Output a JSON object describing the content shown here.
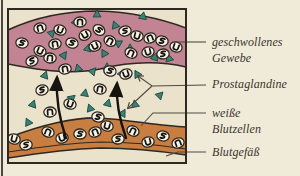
{
  "figure": {
    "labels": {
      "swollen_tissue": "geschwollenes\nGewebe",
      "prostaglandins": "Prostaglandine",
      "white_blood_cells": "weiße\nBlutzellen",
      "blood_vessel": "Blutgefäß"
    }
  },
  "colors": {
    "page_background": "#f0ead9",
    "box_background": "#ebe2cc",
    "tissue_pink": "#c28492",
    "vessel_orange": "#c97e41",
    "prostaglandin_teal": "#3c8173",
    "cell_fill": "#f7f2e4",
    "outline": "#2d2822",
    "callout_line": "#4f4a42",
    "text": "#3a342c"
  },
  "diagram": {
    "box": [
      8,
      9,
      178,
      154
    ],
    "tissue_band": {
      "path": "M8,30 C40,15 70,11 98,11 C130,12 162,19 186,28 L186,67 C160,61 132,61 100,69 C70,75 38,70 8,64 Z"
    },
    "vessel": {
      "path": "M8,138 C40,125 75,117 100,118 C130,120 160,126 186,127 L186,155 C160,151 135,148 100,148 C70,149 40,153 8,158 Z",
      "inner_wall": "M8,152 C40,147 70,143 100,142 C135,142 160,145 186,149"
    },
    "cells": {
      "tissue": [
        [
          22,
          43,
          10,
          0
        ],
        [
          40,
          28,
          -15,
          1
        ],
        [
          60,
          30,
          20,
          2
        ],
        [
          80,
          22,
          0,
          1
        ],
        [
          99,
          30,
          35,
          0
        ],
        [
          85,
          35,
          -30,
          2
        ],
        [
          72,
          43,
          15,
          0
        ],
        [
          55,
          44,
          -10,
          1
        ],
        [
          40,
          51,
          25,
          2
        ],
        [
          32,
          61,
          -20,
          0
        ],
        [
          50,
          58,
          5,
          1
        ],
        [
          95,
          46,
          -25,
          2
        ],
        [
          110,
          41,
          30,
          1
        ],
        [
          125,
          31,
          -10,
          0
        ],
        [
          137,
          36,
          15,
          2
        ],
        [
          150,
          38,
          -20,
          1
        ],
        [
          162,
          41,
          10,
          0
        ],
        [
          148,
          52,
          -15,
          2
        ],
        [
          131,
          53,
          25,
          1
        ],
        [
          163,
          54,
          -5,
          0
        ],
        [
          176,
          47,
          20,
          2
        ]
      ],
      "interstitium": [
        [
          65,
          69,
          -10,
          1
        ],
        [
          110,
          71,
          15,
          0
        ],
        [
          126,
          74,
          -20,
          2
        ],
        [
          100,
          89,
          10,
          1
        ],
        [
          42,
          90,
          -15,
          0
        ],
        [
          70,
          104,
          20,
          2
        ],
        [
          50,
          112,
          -5,
          1
        ],
        [
          98,
          117,
          10,
          0
        ]
      ],
      "vessel": [
        [
          14,
          139,
          15,
          2
        ],
        [
          26,
          145,
          -10,
          0
        ],
        [
          48,
          132,
          20,
          1
        ],
        [
          62,
          138,
          -15,
          2
        ],
        [
          80,
          134,
          5,
          0
        ],
        [
          95,
          132,
          -20,
          1
        ],
        [
          107,
          126,
          15,
          2
        ],
        [
          118,
          139,
          -5,
          0
        ],
        [
          133,
          131,
          25,
          1
        ],
        [
          148,
          142,
          -15,
          2
        ],
        [
          163,
          136,
          10,
          0
        ],
        [
          178,
          143,
          -20,
          1
        ]
      ]
    },
    "triangles": {
      "tissue": [
        [
          97,
          14,
          0
        ],
        [
          76,
          22,
          30
        ],
        [
          115,
          25,
          -20
        ],
        [
          143,
          16,
          10
        ],
        [
          52,
          33,
          45
        ],
        [
          88,
          48,
          15
        ],
        [
          104,
          53,
          -30
        ],
        [
          119,
          43,
          60
        ],
        [
          130,
          48,
          0
        ],
        [
          155,
          57,
          20
        ],
        [
          169,
          58,
          -15
        ],
        [
          64,
          55,
          35
        ]
      ],
      "interstitium": [
        [
          45,
          75,
          20
        ],
        [
          78,
          68,
          -15
        ],
        [
          93,
          71,
          40
        ],
        [
          107,
          67,
          0
        ],
        [
          122,
          73,
          25
        ],
        [
          137,
          74,
          -30
        ],
        [
          85,
          93,
          10
        ],
        [
          72,
          98,
          50
        ],
        [
          90,
          108,
          -20
        ],
        [
          108,
          103,
          15
        ],
        [
          123,
          113,
          30
        ],
        [
          135,
          104,
          -10
        ],
        [
          160,
          95,
          45
        ],
        [
          33,
          104,
          20
        ],
        [
          28,
          122,
          -25
        ]
      ]
    },
    "arrows": [
      "M66,138 C59,118 56,98 57,78",
      "M126,138 C119,118 116,100 117,84"
    ],
    "callouts": [
      {
        "points": "174,42 206,42",
        "arrow": false
      },
      {
        "points": "206,85 152,86 138,76",
        "arrow": true
      },
      {
        "points": "152,86 128,108",
        "arrow": true
      },
      {
        "points": "206,113 153,113 141,126",
        "arrow": false
      },
      {
        "points": "206,152 178,152 166,156",
        "arrow": false
      }
    ]
  }
}
